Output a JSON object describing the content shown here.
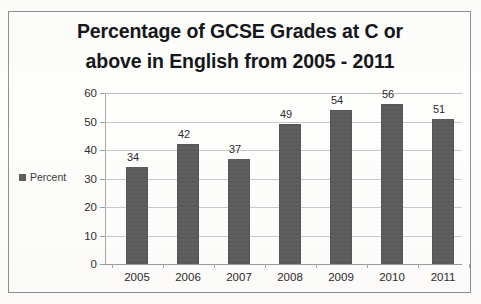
{
  "chart_data": {
    "type": "bar",
    "title": "Percentage of GCSE Grades at C or above in English from 2005 - 2011",
    "title_lines": [
      "Percentage of GCSE Grades at C or",
      "above in English from 2005 - 2011"
    ],
    "categories": [
      "2005",
      "2006",
      "2007",
      "2008",
      "2009",
      "2010",
      "2011"
    ],
    "values": [
      34,
      42,
      37,
      49,
      54,
      56,
      51
    ],
    "series": [
      {
        "name": "Percent",
        "values": [
          34,
          42,
          37,
          49,
          54,
          56,
          51
        ]
      }
    ],
    "data_labels": [
      "34",
      "42",
      "37",
      "49",
      "54",
      "56",
      "51"
    ],
    "xlabel": "",
    "ylabel": "",
    "ylim": [
      0,
      60
    ],
    "ytick_step": 10,
    "ytick_labels": [
      "0",
      "10",
      "20",
      "30",
      "40",
      "50",
      "60"
    ],
    "grid": true,
    "grid_axis": "y",
    "legend": {
      "position": "left",
      "entries": [
        "Percent"
      ]
    },
    "bar_color": "#5a5a5a",
    "grid_color": "#c9c9c9",
    "axis_color": "#a8a8a8",
    "title_color": "#15171a",
    "background_color": "#fdfdfb"
  },
  "legend": {
    "percent_label": "Percent"
  }
}
